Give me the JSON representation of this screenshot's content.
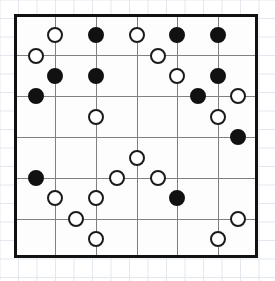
{
  "board": {
    "name": "logic-puzzle-grid",
    "columns": 6,
    "rows": 6,
    "cell_size": 40.6,
    "origin_x": 14,
    "origin_y": 14,
    "width": 244,
    "height": 244,
    "border_color": "#111111",
    "grid_line_color": "#808080",
    "background_color": "#fdfdfd",
    "paper_line_color": "#e3e8ee",
    "paper_cell": 18.5,
    "stone_radius": 8,
    "white_stone_color": "#ffffff",
    "black_stone_color": "#111111",
    "stone_outline_color": "#1a1a1a"
  },
  "stones": [
    {
      "id": "s1",
      "color": "white",
      "cx": 55,
      "cy": 35
    },
    {
      "id": "s2",
      "color": "black",
      "cx": 96,
      "cy": 35
    },
    {
      "id": "s3",
      "color": "white",
      "cx": 137,
      "cy": 35
    },
    {
      "id": "s4",
      "color": "black",
      "cx": 177,
      "cy": 35
    },
    {
      "id": "s5",
      "color": "black",
      "cx": 218,
      "cy": 35
    },
    {
      "id": "s6",
      "color": "white",
      "cx": 36,
      "cy": 56
    },
    {
      "id": "s7",
      "color": "white",
      "cx": 158,
      "cy": 56
    },
    {
      "id": "s8",
      "color": "black",
      "cx": 55,
      "cy": 76
    },
    {
      "id": "s9",
      "color": "black",
      "cx": 96,
      "cy": 76
    },
    {
      "id": "s10",
      "color": "white",
      "cx": 177,
      "cy": 76
    },
    {
      "id": "s11",
      "color": "black",
      "cx": 218,
      "cy": 76
    },
    {
      "id": "s12",
      "color": "black",
      "cx": 36,
      "cy": 96
    },
    {
      "id": "s13",
      "color": "black",
      "cx": 198,
      "cy": 96
    },
    {
      "id": "s14",
      "color": "white",
      "cx": 238,
      "cy": 96
    },
    {
      "id": "s15",
      "color": "white",
      "cx": 96,
      "cy": 117
    },
    {
      "id": "s16",
      "color": "white",
      "cx": 218,
      "cy": 117
    },
    {
      "id": "s17",
      "color": "black",
      "cx": 238,
      "cy": 137
    },
    {
      "id": "s18",
      "color": "white",
      "cx": 137,
      "cy": 158
    },
    {
      "id": "s19",
      "color": "black",
      "cx": 36,
      "cy": 178
    },
    {
      "id": "s20",
      "color": "white",
      "cx": 117,
      "cy": 178
    },
    {
      "id": "s21",
      "color": "white",
      "cx": 158,
      "cy": 178
    },
    {
      "id": "s22",
      "color": "white",
      "cx": 55,
      "cy": 198
    },
    {
      "id": "s23",
      "color": "white",
      "cx": 96,
      "cy": 198
    },
    {
      "id": "s24",
      "color": "black",
      "cx": 177,
      "cy": 198
    },
    {
      "id": "s25",
      "color": "white",
      "cx": 76,
      "cy": 219
    },
    {
      "id": "s26",
      "color": "white",
      "cx": 238,
      "cy": 219
    },
    {
      "id": "s27",
      "color": "white",
      "cx": 96,
      "cy": 239
    },
    {
      "id": "s28",
      "color": "white",
      "cx": 218,
      "cy": 239
    }
  ],
  "grid_lines": {
    "vertical_x": [
      55,
      96,
      137,
      177,
      218
    ],
    "horizontal_y": [
      55,
      96,
      137,
      178,
      219
    ]
  }
}
